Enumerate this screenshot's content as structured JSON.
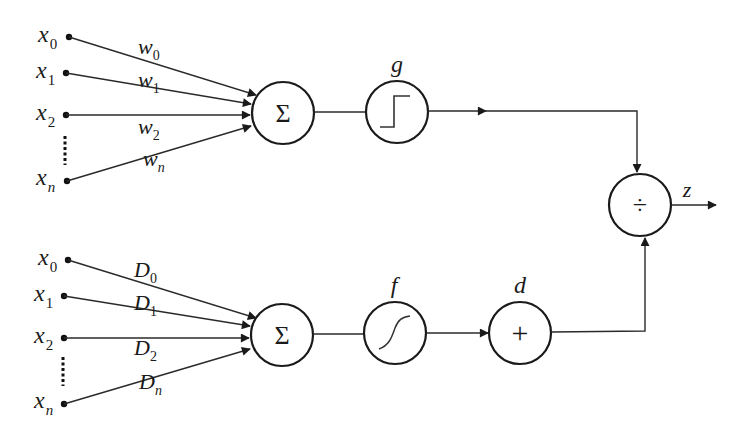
{
  "diagram": {
    "type": "neural-unit-block-diagram",
    "top_branch": {
      "inputs": [
        {
          "var": "x",
          "sub": "0",
          "weight": "w",
          "weight_sub": "0"
        },
        {
          "var": "x",
          "sub": "1",
          "weight": "w",
          "weight_sub": "1"
        },
        {
          "var": "x",
          "sub": "2",
          "weight": "w",
          "weight_sub": "2"
        },
        {
          "var": "x",
          "sub": "n",
          "weight": "w",
          "weight_sub": "n"
        }
      ],
      "sum_symbol": "Σ",
      "activation_label": "g",
      "activation_shape": "step"
    },
    "bottom_branch": {
      "inputs": [
        {
          "var": "x",
          "sub": "0",
          "weight": "D",
          "weight_sub": "0"
        },
        {
          "var": "x",
          "sub": "1",
          "weight": "D",
          "weight_sub": "1"
        },
        {
          "var": "x",
          "sub": "2",
          "weight": "D",
          "weight_sub": "2"
        },
        {
          "var": "x",
          "sub": "n",
          "weight": "D",
          "weight_sub": "n"
        }
      ],
      "sum_symbol": "Σ",
      "activation_label": "f",
      "activation_shape": "sigmoid",
      "adder_label": "d",
      "adder_symbol": "+"
    },
    "combiner": {
      "symbol": "÷",
      "output_label": "z"
    }
  }
}
